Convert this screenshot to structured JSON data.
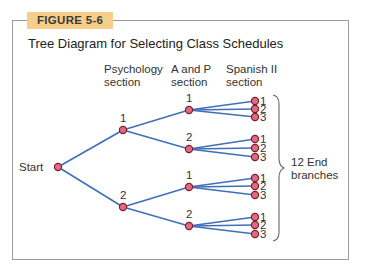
{
  "figure": {
    "tag": "FIGURE 5-6",
    "title": "Tree Diagram for Selecting Class Schedules"
  },
  "columns": {
    "psychology": [
      "Psychology",
      "section"
    ],
    "ap": [
      "A and P",
      "section"
    ],
    "spanish": [
      "Spanish II",
      "section"
    ]
  },
  "start_label": "Start",
  "brace_label": [
    "12 End",
    "branches"
  ],
  "colors": {
    "line": "#3f6fb7",
    "node_fill": "#e06a7e",
    "node_stroke": "#7a2030",
    "tag_bg": "#f5cf8a",
    "frame": "#9a9a9a"
  },
  "tree": {
    "start": {
      "x": 58,
      "y": 167
    },
    "psychology": [
      {
        "label": "1",
        "x": 123,
        "y": 130,
        "ap": [
          {
            "label": "1",
            "x": 189,
            "y": 110,
            "ends": [
              {
                "label": "1",
                "y": 101
              },
              {
                "label": "2",
                "y": 109
              },
              {
                "label": "3",
                "y": 117
              }
            ]
          },
          {
            "label": "2",
            "x": 189,
            "y": 149,
            "ends": [
              {
                "label": "1",
                "y": 139
              },
              {
                "label": "2",
                "y": 148
              },
              {
                "label": "3",
                "y": 157
              }
            ]
          }
        ]
      },
      {
        "label": "2",
        "x": 123,
        "y": 207,
        "ap": [
          {
            "label": "1",
            "x": 189,
            "y": 187,
            "ends": [
              {
                "label": "1",
                "y": 178
              },
              {
                "label": "2",
                "y": 186
              },
              {
                "label": "3",
                "y": 195
              }
            ]
          },
          {
            "label": "2",
            "x": 189,
            "y": 226,
            "ends": [
              {
                "label": "1",
                "y": 217
              },
              {
                "label": "2",
                "y": 225
              },
              {
                "label": "3",
                "y": 234
              }
            ]
          }
        ]
      }
    ],
    "end_x": 255
  }
}
